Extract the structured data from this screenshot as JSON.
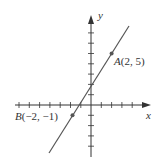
{
  "diagram": {
    "type": "coordinate-plane-line",
    "x_axis_label": "x",
    "y_axis_label": "y",
    "points": [
      {
        "name": "A",
        "x": 2,
        "y": 5,
        "label": "A(2, 5)"
      },
      {
        "name": "B",
        "x": -2,
        "y": -1,
        "label": "B(−2, −1)"
      }
    ],
    "line": {
      "slope": 1.5,
      "intercept": 2
    },
    "colors": {
      "line": "#555555",
      "axis": "#333333",
      "point": "#555555"
    }
  },
  "labels": {
    "y": "y",
    "x": "x",
    "A_name": "A",
    "A_coords": "(2, 5)",
    "B_name": "B",
    "B_coords": "(−2, −1)"
  }
}
